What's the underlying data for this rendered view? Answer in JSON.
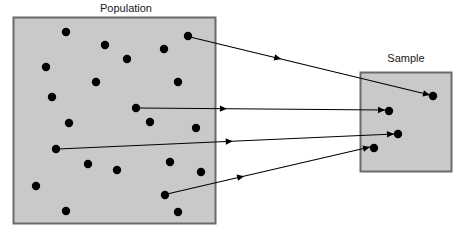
{
  "figure": {
    "type": "diagram",
    "width": 471,
    "height": 237,
    "background_color": "#ffffff",
    "line_color": "#000000",
    "dot_color": "#000000",
    "box_fill_color": "#c9c9c9",
    "box_border_color": "#6b6b6b"
  },
  "population": {
    "label": "Population",
    "label_x": 126,
    "label_y": 12,
    "box": {
      "x": 13,
      "y": 17,
      "width": 203,
      "height": 207
    },
    "dot_radius": 4.2,
    "dots": [
      {
        "x": 66,
        "y": 32,
        "selected": false
      },
      {
        "x": 105,
        "y": 45,
        "selected": false
      },
      {
        "x": 188,
        "y": 36,
        "selected": true
      },
      {
        "x": 164,
        "y": 49,
        "selected": false
      },
      {
        "x": 46,
        "y": 67,
        "selected": false
      },
      {
        "x": 127,
        "y": 59,
        "selected": false
      },
      {
        "x": 96,
        "y": 82,
        "selected": false
      },
      {
        "x": 178,
        "y": 82,
        "selected": false
      },
      {
        "x": 52,
        "y": 97,
        "selected": false
      },
      {
        "x": 136,
        "y": 108,
        "selected": true
      },
      {
        "x": 69,
        "y": 123,
        "selected": false
      },
      {
        "x": 150,
        "y": 122,
        "selected": false
      },
      {
        "x": 196,
        "y": 128,
        "selected": false
      },
      {
        "x": 56,
        "y": 149,
        "selected": true
      },
      {
        "x": 88,
        "y": 164,
        "selected": false
      },
      {
        "x": 117,
        "y": 170,
        "selected": false
      },
      {
        "x": 170,
        "y": 162,
        "selected": false
      },
      {
        "x": 201,
        "y": 172,
        "selected": false
      },
      {
        "x": 36,
        "y": 186,
        "selected": false
      },
      {
        "x": 165,
        "y": 195,
        "selected": true
      },
      {
        "x": 66,
        "y": 211,
        "selected": false
      },
      {
        "x": 178,
        "y": 212,
        "selected": false
      }
    ]
  },
  "sample": {
    "label": "Sample",
    "label_x": 406,
    "label_y": 62,
    "box": {
      "x": 360,
      "y": 72,
      "width": 92,
      "height": 100
    },
    "dot_radius": 4.2,
    "dots": [
      {
        "x": 433,
        "y": 96
      },
      {
        "x": 389,
        "y": 111
      },
      {
        "x": 398,
        "y": 134
      },
      {
        "x": 374,
        "y": 148
      }
    ]
  },
  "arrows": [
    {
      "name": "arrow-1",
      "x1": 190,
      "y1": 37,
      "x2": 430,
      "y2": 95,
      "mid_head_t": 0.38
    },
    {
      "name": "arrow-2",
      "x1": 138,
      "y1": 108,
      "x2": 385,
      "y2": 110,
      "mid_head_t": 0.36
    },
    {
      "name": "arrow-3",
      "x1": 58,
      "y1": 149,
      "x2": 394,
      "y2": 134,
      "mid_head_t": 0.52
    },
    {
      "name": "arrow-4",
      "x1": 167,
      "y1": 194,
      "x2": 370,
      "y2": 147,
      "mid_head_t": 0.38
    }
  ]
}
